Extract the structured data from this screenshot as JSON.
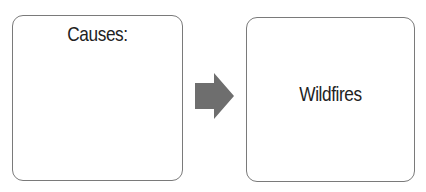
{
  "diagram": {
    "type": "flow",
    "nodes": [
      {
        "id": "causes",
        "label": "Causes:"
      },
      {
        "id": "wildfires",
        "label": "Wildfires"
      }
    ],
    "edges": [
      {
        "from": "causes",
        "to": "wildfires",
        "style": "block-arrow"
      }
    ],
    "colors": {
      "arrow": "#6e6e6e",
      "border": "#7a7a7a",
      "text": "#222222"
    }
  }
}
